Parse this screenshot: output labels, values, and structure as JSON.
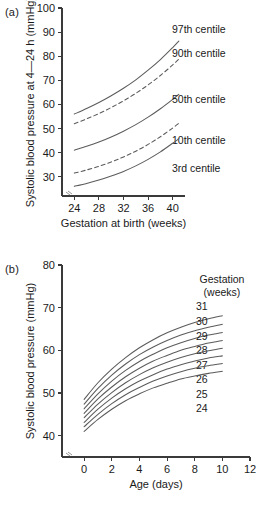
{
  "figure": {
    "panel_a_label": "(a)",
    "panel_b_label": "(b)"
  },
  "chart_data": [
    {
      "id": "panel-a",
      "type": "line",
      "title": "",
      "xlabel": "Gestation at birth (weeks)",
      "ylabel": "Systolic blood pressure at 4—24 h (mmHg)",
      "xlim": [
        22,
        42
      ],
      "ylim": [
        22,
        100
      ],
      "xticks": [
        24,
        28,
        32,
        36,
        40
      ],
      "yticks": [
        30,
        40,
        50,
        60,
        70,
        80,
        90,
        100
      ],
      "grid": false,
      "axis_break": true,
      "legend_position": "right-inline",
      "x": [
        24,
        26,
        28,
        30,
        32,
        34,
        36,
        38,
        40,
        41
      ],
      "series": [
        {
          "name": "97th centile",
          "label": "97th centile",
          "style": "solid",
          "values": [
            56.0,
            58.3,
            60.8,
            63.6,
            66.7,
            70.2,
            74.2,
            78.6,
            83.6,
            86.3
          ]
        },
        {
          "name": "90th centile",
          "label": "90th centile",
          "style": "dashed",
          "values": [
            52.0,
            54.0,
            56.2,
            58.7,
            61.5,
            64.6,
            68.1,
            72.0,
            76.4,
            78.8
          ]
        },
        {
          "name": "50th centile",
          "label": "50th centile",
          "style": "solid",
          "values": [
            41.0,
            42.6,
            44.4,
            46.5,
            48.9,
            51.6,
            54.7,
            58.2,
            62.1,
            64.2
          ]
        },
        {
          "name": "10th centile",
          "label": "10th centile",
          "style": "dashed",
          "values": [
            31.5,
            32.8,
            34.3,
            36.1,
            38.2,
            40.6,
            43.4,
            46.6,
            50.2,
            52.2
          ]
        },
        {
          "name": "3rd centile",
          "label": "3rd centile",
          "style": "solid",
          "values": [
            26.0,
            27.2,
            28.6,
            30.3,
            32.2,
            34.5,
            37.2,
            40.3,
            43.9,
            45.8
          ]
        }
      ]
    },
    {
      "id": "panel-b",
      "type": "line",
      "title": "",
      "xlabel": "Age (days)",
      "ylabel": "Systolic blood pressure (mmHg)",
      "xlim": [
        -1.6,
        12
      ],
      "ylim": [
        35,
        80
      ],
      "xticks": [
        0,
        2,
        4,
        6,
        8,
        10,
        12
      ],
      "yticks": [
        40,
        50,
        60,
        70,
        80
      ],
      "grid": false,
      "axis_break": true,
      "legend_title_line1": "Gestation",
      "legend_title_line2": "(weeks)",
      "legend_position": "right-inline",
      "x": [
        0,
        1,
        2,
        3,
        4,
        5,
        6,
        7,
        8,
        9,
        10
      ],
      "series": [
        {
          "name": "31",
          "label": "31",
          "style": "solid",
          "values": [
            48.5,
            52.4,
            55.6,
            58.3,
            60.6,
            62.5,
            64.1,
            65.4,
            66.5,
            67.4,
            68.1
          ]
        },
        {
          "name": "30",
          "label": "30",
          "style": "solid",
          "values": [
            47.4,
            51.1,
            54.2,
            56.8,
            59.0,
            60.8,
            62.3,
            63.6,
            64.6,
            65.4,
            66.1
          ]
        },
        {
          "name": "29",
          "label": "29",
          "style": "solid",
          "values": [
            46.3,
            49.8,
            52.8,
            55.3,
            57.4,
            59.1,
            60.6,
            61.8,
            62.8,
            63.6,
            64.2
          ]
        },
        {
          "name": "28",
          "label": "28",
          "style": "solid",
          "values": [
            45.2,
            48.6,
            51.4,
            53.8,
            55.8,
            57.5,
            58.8,
            60.0,
            60.9,
            61.7,
            62.3
          ]
        },
        {
          "name": "27",
          "label": "27",
          "style": "solid",
          "values": [
            44.2,
            47.4,
            50.1,
            52.4,
            54.3,
            55.9,
            57.2,
            58.3,
            59.2,
            59.9,
            60.5
          ]
        },
        {
          "name": "26",
          "label": "26",
          "style": "solid",
          "values": [
            43.1,
            46.2,
            48.8,
            51.0,
            52.8,
            54.3,
            55.6,
            56.6,
            57.5,
            58.2,
            58.7
          ]
        },
        {
          "name": "25",
          "label": "25",
          "style": "solid",
          "values": [
            42.1,
            45.0,
            47.5,
            49.6,
            51.3,
            52.8,
            54.0,
            55.0,
            55.8,
            56.4,
            56.9
          ]
        },
        {
          "name": "24",
          "label": "24",
          "style": "solid",
          "values": [
            41.0,
            43.8,
            46.2,
            48.2,
            49.8,
            51.2,
            52.3,
            53.3,
            54.0,
            54.6,
            55.1
          ]
        }
      ]
    }
  ]
}
